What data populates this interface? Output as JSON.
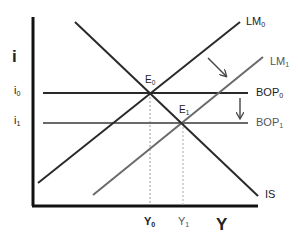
{
  "diagram": {
    "type": "IS-LM-BOP",
    "axes": {
      "y_label": "i",
      "x_label": "Y",
      "y_ticks": [
        {
          "base": "i",
          "sub": "0"
        },
        {
          "base": "i",
          "sub": "1"
        }
      ],
      "x_ticks": [
        {
          "base": "Y",
          "sub": "0"
        },
        {
          "base": "Y",
          "sub": "1"
        }
      ]
    },
    "curves": {
      "lm0": {
        "base": "LM",
        "sub": "0",
        "color": "#2a2a2a"
      },
      "lm1": {
        "base": "LM",
        "sub": "1",
        "color": "#6a6a6a"
      },
      "bop0": {
        "base": "BOP",
        "sub": "0",
        "color": "#2a2a2a"
      },
      "bop1": {
        "base": "BOP",
        "sub": "1",
        "color": "#6a6a6a"
      },
      "is": {
        "base": "IS",
        "sub": "",
        "color": "#2a2a2a"
      }
    },
    "equilibria": [
      {
        "base": "E",
        "sub": "0"
      },
      {
        "base": "E",
        "sub": "1"
      }
    ]
  }
}
